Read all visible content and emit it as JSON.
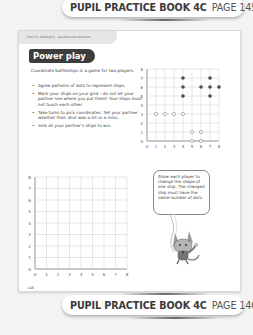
{
  "banner_top": {
    "book": "PUPIL PRACTICE BOOK 4C",
    "page": "PAGE 145"
  },
  "banner_bottom": {
    "book": "PUPIL PRACTICE BOOK 4C",
    "page": "PAGE 146"
  },
  "page": {
    "unit_header": "Unit 14: Geometry – position and direction",
    "title": "Power play",
    "intro": "Coordinate battleships is a game for two players.",
    "bullets": [
      "Agree patterns of dots to represent ships.",
      "Mark your ships on your grid – do not let your partner see where you put them! Your ships must not touch each other.",
      "Take turns to pick coordinates. Tell your partner whether their shot was a hit or a miss.",
      "Sink all your partner's ships to win."
    ],
    "page_number": "146"
  },
  "example_grid": {
    "x_ticks": [
      "0",
      "1",
      "2",
      "3",
      "4",
      "5",
      "6",
      "7",
      "8"
    ],
    "y_ticks": [
      "0",
      "1",
      "2",
      "3",
      "4",
      "5",
      "6",
      "7",
      "8"
    ],
    "filled_dots": [
      [
        4,
        7
      ],
      [
        4,
        6
      ],
      [
        4,
        5
      ],
      [
        7,
        7
      ],
      [
        6,
        6
      ],
      [
        7,
        6
      ],
      [
        8,
        6
      ],
      [
        7,
        5
      ]
    ],
    "open_dots": [
      [
        1,
        3
      ],
      [
        2,
        3
      ],
      [
        3,
        3
      ],
      [
        4,
        3
      ],
      [
        5,
        1
      ],
      [
        6,
        1
      ],
      [
        5,
        0
      ],
      [
        6,
        0
      ]
    ],
    "dot_color": "#4a4a4a"
  },
  "blank_grid": {
    "x_ticks": [
      "0",
      "1",
      "2",
      "3",
      "4",
      "5",
      "6",
      "7",
      "8"
    ],
    "y_ticks": [
      "0",
      "1",
      "2",
      "3",
      "4",
      "5",
      "6",
      "7",
      "8"
    ]
  },
  "speech_bubble": {
    "text": "Allow each player to change the shape of one ship. The changed ship must have the same number of dots."
  },
  "mascot": {
    "icon": "cat-mascot-icon"
  }
}
